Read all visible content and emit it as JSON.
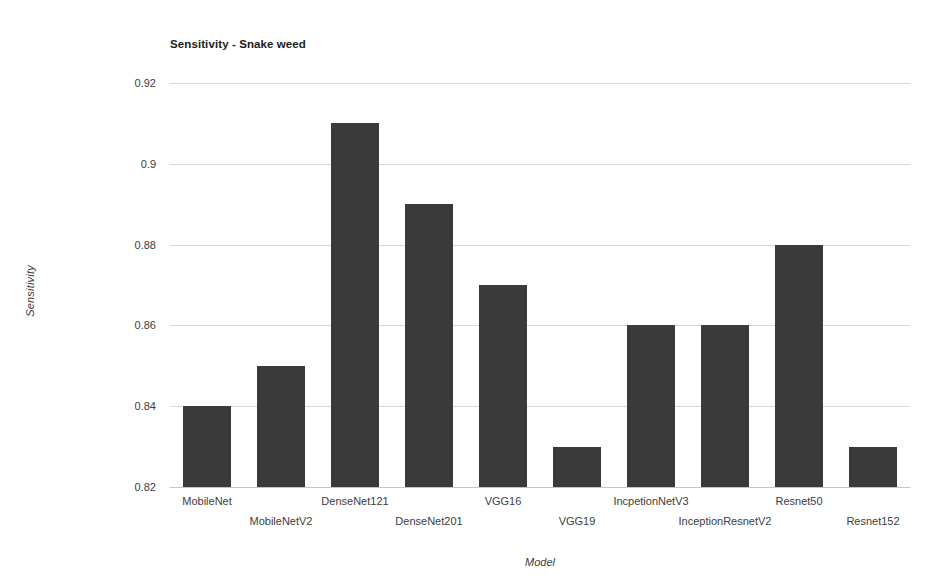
{
  "chart_data": {
    "type": "bar",
    "title": "Sensitivity - Snake weed",
    "xlabel": "Model",
    "ylabel": "Sensitivity",
    "categories": [
      "MobileNet",
      "MobileNetV2",
      "DenseNet121",
      "DenseNet201",
      "VGG16",
      "VGG19",
      "IncpetionNetV3",
      "InceptionResnetV2",
      "Resnet50",
      "Resnet152"
    ],
    "values": [
      0.84,
      0.85,
      0.91,
      0.89,
      0.87,
      0.83,
      0.86,
      0.86,
      0.88,
      0.83
    ],
    "ylim": [
      0.82,
      0.92
    ],
    "ytick_labels": [
      "0.92",
      "0.9",
      "0.88",
      "0.86",
      "0.84",
      "0.82"
    ],
    "ytick_values": [
      0.92,
      0.9,
      0.88,
      0.86,
      0.84,
      0.82
    ],
    "grid": true,
    "legend": "none",
    "bar_color": "#3a3a3a",
    "grid_color": "#d6d8da",
    "background_color": "#ffffff"
  }
}
